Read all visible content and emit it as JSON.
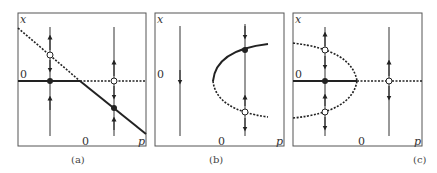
{
  "figure": {
    "panels": [
      {
        "id": "a",
        "caption": "(a)",
        "x_axis_label": "p",
        "y_axis_label": "x",
        "zero_x": "0",
        "zero_y": "0",
        "type": "transcritical"
      },
      {
        "id": "b",
        "caption": "(b)",
        "x_axis_label": "p",
        "y_axis_label": "x",
        "zero_x": "0",
        "zero_y": "0",
        "type": "saddle-node"
      },
      {
        "id": "c",
        "caption": "(c)",
        "x_axis_label": "p",
        "y_axis_label": "x",
        "zero_x": "0",
        "zero_y": "0",
        "type": "subcritical-pitchfork"
      }
    ],
    "legend": {
      "solid": "stable equilibrium",
      "dotted": "unstable equilibrium",
      "filled_dot": "stable fixed point",
      "open_dot": "unstable fixed point"
    },
    "colors": {
      "line": "#222222",
      "frame": "#555555",
      "background": "#ffffff"
    }
  }
}
